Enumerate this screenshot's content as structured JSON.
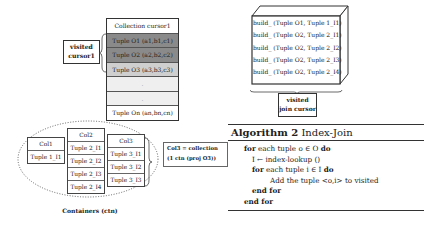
{
  "collection_cursor": {
    "header": "Collection cursor1",
    "rows": [
      {
        "label": "Tuple O1 (a1,b1,c1)",
        "state": "visited-dark"
      },
      {
        "label": "Tuple O2 (a2,b2,c2)",
        "state": "visited-dark"
      },
      {
        "label": "Tuple O3 (a3,b3,c3)",
        "state": "current-light"
      },
      {
        "label": ".",
        "state": "empty"
      },
      {
        "label": ".",
        "state": "empty"
      },
      {
        "label": "Tuple On (an,bn,cn)",
        "state": "normal"
      }
    ],
    "visited_label_line1": "visited",
    "visited_label_line2": "cursor1"
  },
  "join_cursor": {
    "rows": [
      "build_ (Tuple O1, Tuple 1_I1)",
      "build_ (Tuple O2, Tuple 2_I1)",
      "build_ (Tuple O2, Tuple 2_I2)",
      "build_ (Tuple O2, Tuple 2_I3)",
      "build_ (Tuple O2, Tuple 2_I4)"
    ],
    "visited_label_line1": "visited",
    "visited_label_line2": "join cursor"
  },
  "containers": {
    "col1": {
      "header": "Col1",
      "cells": [
        "Tuple 1_I1"
      ]
    },
    "col2": {
      "header": "Col2",
      "cells": [
        "Tuple 2_I1",
        "Tuple 2_I2",
        "Tuple 2_I3",
        "Tuple 2_I4"
      ]
    },
    "col3": {
      "header": "Col3",
      "cells": [
        "Tuple 3_I1",
        "Tuple 3_I2",
        "Tuple 3_I3"
      ]
    },
    "note_line1": "Col3 = collection",
    "note_line2": "(1 ctn (proj O3))",
    "label": "Containers (ctn)"
  },
  "algorithm": {
    "title_bold": "Algorithm 2",
    "title_rest": "Index-Join",
    "lines": [
      {
        "kw1": "for",
        "text": " each tuple o ∈ O ",
        "kw2": "do",
        "indent": 0
      },
      {
        "kw1": "",
        "text": "I ← index-lookup ()",
        "kw2": "",
        "indent": 1
      },
      {
        "kw1": "for",
        "text": " each tuple i ∈ I ",
        "kw2": "do",
        "indent": 1
      },
      {
        "kw1": "",
        "text": "Add the tuple <o,i> to visited",
        "kw2": "",
        "indent": 2
      },
      {
        "kw1": "end for",
        "text": "",
        "kw2": "",
        "indent": 1
      },
      {
        "kw1": "end for",
        "text": "",
        "kw2": "",
        "indent": 0
      }
    ]
  }
}
